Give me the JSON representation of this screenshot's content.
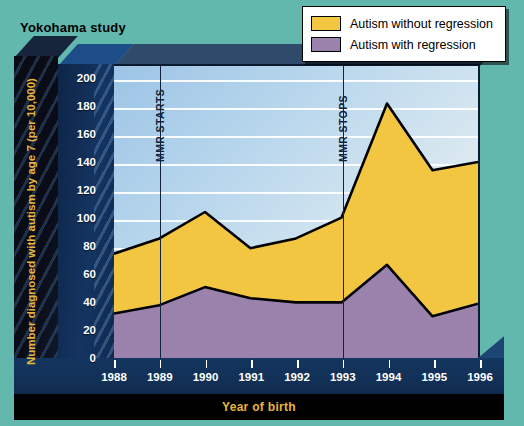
{
  "title": "Yokohama study",
  "legend": {
    "items": [
      {
        "label": "Autism without regression",
        "color": "#f2c640",
        "key": "without_regression"
      },
      {
        "label": "Autism with regression",
        "color": "#9b82ad",
        "key": "with_regression"
      }
    ]
  },
  "annotations": [
    {
      "label": "MMR STARTS",
      "x": 1989
    },
    {
      "label": "MMR STOPS",
      "x": 1993
    }
  ],
  "colors": {
    "background": "#63b8ae",
    "plot_background": "#b7d6ec",
    "axis_block": "#123056",
    "axis_text": "#e8b63a",
    "gridline": "#ffffff",
    "without_regression": "#f2c640",
    "with_regression": "#9b82ad",
    "outline": "#000000"
  },
  "chart_data": {
    "type": "area",
    "stacked": true,
    "title": "Yokohama study",
    "xlabel": "Year of birth",
    "ylabel": "Number diagnosed with autism by age 7 (per 10,000)",
    "x": [
      1988,
      1989,
      1990,
      1991,
      1992,
      1993,
      1994,
      1995,
      1996
    ],
    "xtick_labels": [
      "1988",
      "1989",
      "1990",
      "1991",
      "1992",
      "1993",
      "1994",
      "1995",
      "1996"
    ],
    "ytick_labels": [
      "0",
      "20",
      "40",
      "60",
      "80",
      "100",
      "120",
      "140",
      "160",
      "180",
      "200"
    ],
    "yticks": [
      0,
      20,
      40,
      60,
      80,
      100,
      120,
      140,
      160,
      180,
      200
    ],
    "ylim": [
      0,
      210
    ],
    "xlim": [
      1988,
      1996
    ],
    "grid": true,
    "legend_position": "top-right",
    "series": [
      {
        "name": "Autism with regression",
        "color": "#9b82ad",
        "values": [
          32,
          38,
          51,
          43,
          40,
          40,
          67,
          30,
          39
        ]
      },
      {
        "name": "Autism without regression",
        "color": "#f2c640",
        "values": [
          43,
          48,
          54,
          36,
          46,
          61,
          116,
          105,
          102
        ]
      }
    ],
    "totals": [
      75,
      86,
      105,
      79,
      86,
      101,
      183,
      135,
      141
    ],
    "annotations": [
      {
        "text": "MMR STARTS",
        "x": 1989,
        "orientation": "vertical"
      },
      {
        "text": "MMR STOPS",
        "x": 1993,
        "orientation": "vertical"
      }
    ]
  }
}
